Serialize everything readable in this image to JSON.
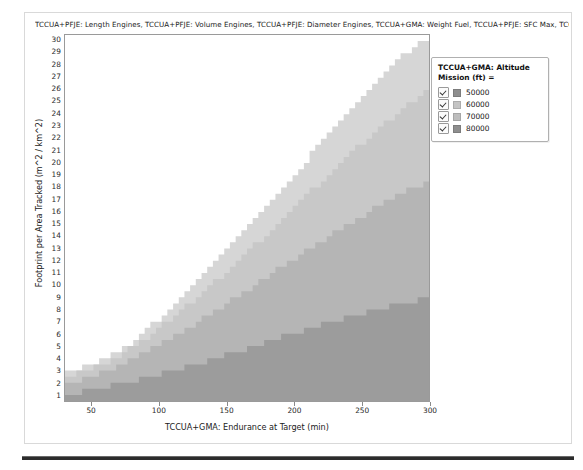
{
  "chart_data": {
    "type": "area",
    "title": "TCCUA+PFJE: Length Engines, TCCUA+PFJE: Volume Engines, TCCUA+PFJE: Diameter Engines, TCCUA+GMA: Weight Fuel, TCCUA+PFJE: SFC Max, TCCUA+PFJE: S",
    "xlabel": "TCCUA+GMA: Endurance at Target (min)",
    "ylabel": "Footprint per Area Tracked (m^2 / km^2)",
    "xlim": [
      30,
      300
    ],
    "ylim": [
      0.5,
      30.5
    ],
    "xticks": [
      50,
      100,
      150,
      200,
      250,
      300
    ],
    "yticks": [
      1,
      2,
      3,
      4,
      5,
      6,
      7,
      8,
      9,
      10,
      11,
      12,
      13,
      14,
      15,
      16,
      17,
      18,
      19,
      20,
      21,
      22,
      23,
      24,
      25,
      26,
      27,
      28,
      29,
      30
    ],
    "grid": false,
    "legend_position": "right-top",
    "legend_title": "TCCUA+GMA: Altitude Mission (ft) =",
    "series": [
      {
        "name": "50000",
        "color": "#9c9c9c",
        "checked": true,
        "boundary_x": [
          30,
          45,
          60,
          80,
          100,
          120,
          140,
          160,
          180,
          200,
          220,
          240,
          260,
          280,
          300
        ],
        "boundary_y": [
          1.0,
          1.3,
          1.7,
          2.2,
          2.8,
          3.4,
          4.0,
          4.7,
          5.4,
          6.1,
          6.8,
          7.4,
          8.0,
          8.5,
          9.0
        ]
      },
      {
        "name": "60000",
        "color": "#b5b5b5",
        "checked": true,
        "boundary_x": [
          30,
          45,
          60,
          80,
          100,
          120,
          140,
          160,
          180,
          200,
          220,
          240,
          260,
          280,
          300
        ],
        "boundary_y": [
          2.0,
          2.4,
          3.0,
          4.0,
          5.2,
          6.5,
          7.9,
          9.3,
          10.8,
          12.3,
          13.7,
          15.1,
          16.4,
          17.6,
          18.7
        ]
      },
      {
        "name": "70000",
        "color": "#c8c8c8",
        "checked": true,
        "boundary_x": [
          30,
          45,
          60,
          80,
          100,
          120,
          140,
          160,
          180,
          200,
          220,
          240,
          260,
          280,
          300
        ],
        "boundary_y": [
          2.6,
          3.0,
          3.7,
          5.0,
          6.6,
          8.4,
          10.3,
          12.3,
          14.4,
          16.6,
          18.7,
          20.8,
          22.8,
          24.6,
          26.3
        ]
      },
      {
        "name": "80000",
        "color": "#d6d6d6",
        "checked": true,
        "boundary_x": [
          30,
          45,
          60,
          80,
          100,
          120,
          140,
          160,
          180,
          200,
          220,
          240,
          260,
          280,
          300
        ],
        "boundary_y": [
          3.0,
          3.3,
          4.0,
          5.5,
          7.4,
          9.5,
          11.8,
          14.2,
          16.7,
          19.3,
          21.9,
          24.4,
          26.8,
          29.0,
          30.5
        ]
      }
    ],
    "legend_items": [
      {
        "label": "50000",
        "color": "#8e8e8e",
        "checked": true
      },
      {
        "label": "60000",
        "color": "#c4c4c4",
        "checked": true
      },
      {
        "label": "70000",
        "color": "#bdbdbd",
        "checked": true
      },
      {
        "label": "80000",
        "color": "#8e8e8e",
        "checked": true
      }
    ]
  }
}
